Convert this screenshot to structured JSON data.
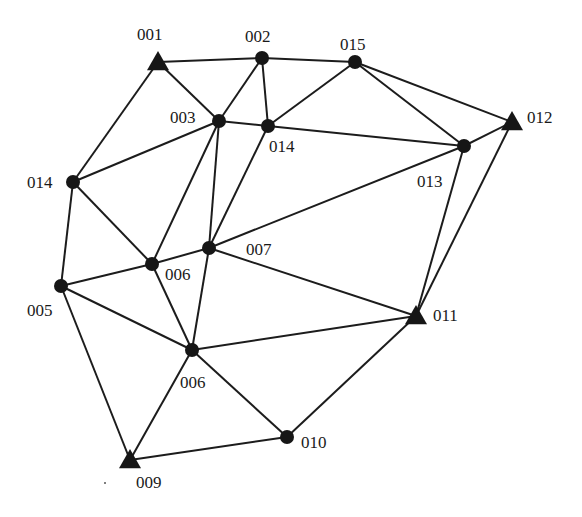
{
  "diagram": {
    "type": "network-graph",
    "colors": {
      "node": "#161616",
      "edge": "#1c1c1c",
      "label": "#1a1a1a",
      "background": "#ffffff"
    },
    "nodes": [
      {
        "id": "n001",
        "label": "001",
        "shape": "triangle",
        "x": 158,
        "y": 62,
        "lx": 137,
        "ly": 40,
        "anchor": "start"
      },
      {
        "id": "n002",
        "label": "002",
        "shape": "circle",
        "x": 262,
        "y": 58,
        "lx": 245,
        "ly": 42,
        "anchor": "start"
      },
      {
        "id": "n015",
        "label": "015",
        "shape": "circle",
        "x": 355,
        "y": 62,
        "lx": 340,
        "ly": 50,
        "anchor": "start"
      },
      {
        "id": "n003",
        "label": "003",
        "shape": "circle",
        "x": 219,
        "y": 121,
        "lx": 170,
        "ly": 123,
        "anchor": "start"
      },
      {
        "id": "n014r",
        "label": "014",
        "shape": "circle",
        "x": 268,
        "y": 126,
        "lx": 269,
        "ly": 152,
        "anchor": "start"
      },
      {
        "id": "n012",
        "label": "012",
        "shape": "triangle",
        "x": 512,
        "y": 122,
        "lx": 527,
        "ly": 123,
        "anchor": "start"
      },
      {
        "id": "n013",
        "label": "013",
        "shape": "circle",
        "x": 464,
        "y": 146,
        "lx": 417,
        "ly": 187,
        "anchor": "start"
      },
      {
        "id": "n014l",
        "label": "014",
        "shape": "circle",
        "x": 73,
        "y": 182,
        "lx": 27,
        "ly": 188,
        "anchor": "start"
      },
      {
        "id": "n007",
        "label": "007",
        "shape": "circle",
        "x": 209,
        "y": 248,
        "lx": 246,
        "ly": 255,
        "anchor": "start"
      },
      {
        "id": "n006u",
        "label": "006",
        "shape": "circle",
        "x": 152,
        "y": 264,
        "lx": 165,
        "ly": 280,
        "anchor": "start"
      },
      {
        "id": "n005",
        "label": "005",
        "shape": "circle",
        "x": 61,
        "y": 286,
        "lx": 27,
        "ly": 316,
        "anchor": "start"
      },
      {
        "id": "n011",
        "label": "011",
        "shape": "triangle",
        "x": 416,
        "y": 316,
        "lx": 433,
        "ly": 321,
        "anchor": "start"
      },
      {
        "id": "n006l",
        "label": "006",
        "shape": "circle",
        "x": 192,
        "y": 350,
        "lx": 180,
        "ly": 388,
        "anchor": "start"
      },
      {
        "id": "n010",
        "label": "010",
        "shape": "circle",
        "x": 287,
        "y": 437,
        "lx": 301,
        "ly": 448,
        "anchor": "start"
      },
      {
        "id": "n009",
        "label": "009",
        "shape": "triangle",
        "x": 130,
        "y": 460,
        "lx": 136,
        "ly": 488,
        "anchor": "start"
      }
    ],
    "edges": [
      [
        "n001",
        "n002"
      ],
      [
        "n002",
        "n015"
      ],
      [
        "n001",
        "n003"
      ],
      [
        "n001",
        "n014l"
      ],
      [
        "n002",
        "n003"
      ],
      [
        "n002",
        "n014r"
      ],
      [
        "n015",
        "n014r"
      ],
      [
        "n015",
        "n013"
      ],
      [
        "n015",
        "n012"
      ],
      [
        "n003",
        "n014r"
      ],
      [
        "n003",
        "n014l"
      ],
      [
        "n003",
        "n006u"
      ],
      [
        "n003",
        "n007"
      ],
      [
        "n014r",
        "n007"
      ],
      [
        "n014r",
        "n013"
      ],
      [
        "n013",
        "n012"
      ],
      [
        "n013",
        "n007"
      ],
      [
        "n013",
        "n011"
      ],
      [
        "n012",
        "n011"
      ],
      [
        "n014l",
        "n006u"
      ],
      [
        "n014l",
        "n005"
      ],
      [
        "n006u",
        "n007"
      ],
      [
        "n006u",
        "n005"
      ],
      [
        "n006u",
        "n006l"
      ],
      [
        "n007",
        "n006l"
      ],
      [
        "n007",
        "n011"
      ],
      [
        "n005",
        "n006l"
      ],
      [
        "n005",
        "n009"
      ],
      [
        "n006l",
        "n011"
      ],
      [
        "n006l",
        "n010"
      ],
      [
        "n006l",
        "n009"
      ],
      [
        "n011",
        "n010"
      ],
      [
        "n010",
        "n009"
      ]
    ],
    "node_shapes": {
      "circle": "circle-node-icon",
      "triangle": "triangle-node-icon"
    }
  }
}
